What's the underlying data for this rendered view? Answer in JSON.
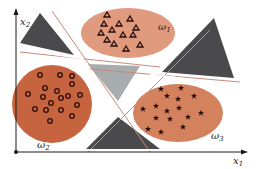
{
  "axes": {
    "x_label": "x",
    "x_sub": "1",
    "y_label": "x",
    "y_sub": "2"
  },
  "classes": [
    {
      "id": "omega1",
      "label": "ω",
      "sub": "1",
      "marker": "triangle",
      "color": "#e09a7e"
    },
    {
      "id": "omega2",
      "label": "ω",
      "sub": "2",
      "marker": "circle",
      "color": "#c6643f"
    },
    {
      "id": "omega3",
      "label": "ω",
      "sub": "3",
      "marker": "star",
      "color": "#d4825e"
    }
  ],
  "colors": {
    "axis": "#1a1a1a",
    "boundary_line": "#c98a7a",
    "dark_region": "#4a4a4c",
    "gray_region": "#a7acae",
    "marker": "#2a0d08"
  }
}
